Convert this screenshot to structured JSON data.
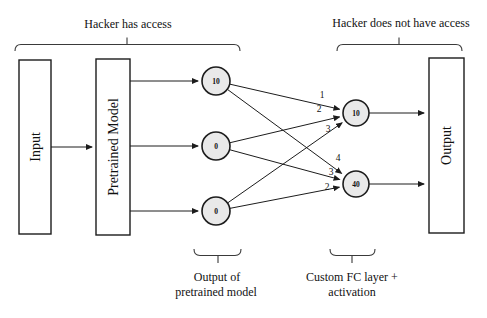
{
  "figure": {
    "access_labels": {
      "has_access": "Hacker has access",
      "no_access": "Hacker does not have access"
    },
    "blocks": {
      "input": "Input",
      "pretrained_model": "Pretrained Model",
      "output": "Output"
    },
    "pretrained_output_neurons": [
      {
        "value": "10"
      },
      {
        "value": "0"
      },
      {
        "value": "0"
      }
    ],
    "fc_neurons": [
      {
        "value": "10"
      },
      {
        "value": "40"
      }
    ],
    "edge_weights": [
      {
        "label": "1"
      },
      {
        "label": "2"
      },
      {
        "label": "3"
      },
      {
        "label": "4"
      },
      {
        "label": "3"
      },
      {
        "label": "2"
      }
    ],
    "annotations": {
      "pretrained_output": {
        "line1": "Output of",
        "line2": "pretrained model"
      },
      "custom_fc": {
        "line1": "Custom FC layer +",
        "line2": "activation"
      }
    },
    "colors": {
      "line": "#1c1c1c",
      "neuron_fill": "#e9e9e9",
      "background": "#ffffff"
    }
  }
}
